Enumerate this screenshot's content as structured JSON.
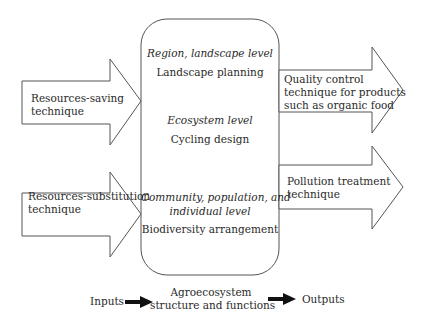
{
  "diagram": {
    "central_box": {
      "levels": [
        {
          "level": "Region, landscape level",
          "design": "Landscape planning"
        },
        {
          "level": "Ecosystem level",
          "design": "Cycling design"
        },
        {
          "level_line1": "Community, population, and",
          "level_line2": "individual level",
          "design": "Biodiversity arrangement"
        }
      ]
    },
    "input_arrows": [
      {
        "line1": "Resources-saving",
        "line2": "technique"
      },
      {
        "line1": "Resources-substitution",
        "line2": "technique"
      }
    ],
    "output_arrows": [
      {
        "line1": "Quality control",
        "line2": "technique for products",
        "line3": "such as organic food"
      },
      {
        "line1": "Pollution treatment",
        "line2": "technique"
      }
    ],
    "legend": {
      "inputs": "Inputs",
      "center_line1": "Agroecosystem",
      "center_line2": "structure and functions",
      "outputs": "Outputs"
    },
    "colors": {
      "stroke": "#555555",
      "text": "#2a2a2a",
      "legend_arrow": "#111111"
    }
  }
}
